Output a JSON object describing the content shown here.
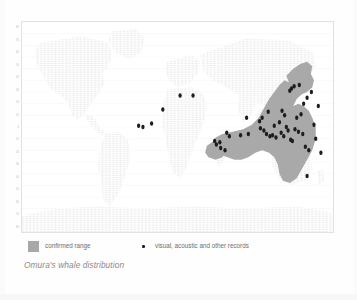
{
  "caption": "Omura's whale distribution",
  "legend": {
    "range": {
      "label": "confirmed range",
      "color": "#a8a8a8",
      "icon": "filled-square-swatch"
    },
    "records": {
      "label": "visual, acoustic and other records",
      "color": "#1d1d1d",
      "icon": "dot-marker"
    }
  },
  "axis": {
    "y_label": "",
    "y_ticks": [
      "80",
      "70",
      "60",
      "50",
      "40",
      "30",
      "20",
      "10",
      "0",
      "10",
      "20",
      "30",
      "40",
      "50",
      "60",
      "70",
      "80"
    ]
  },
  "chart_data": {
    "type": "scatter",
    "title": "Omura's whale distribution",
    "subtitle": "",
    "xlabel": "Longitude",
    "ylabel": "Latitude",
    "xlim": [
      -180,
      180
    ],
    "ylim": [
      -90,
      90
    ],
    "grid": true,
    "legend_position": "below-plot",
    "projection": "equirectangular world map",
    "basemap": {
      "land_color": "#ececec",
      "ocean_color": "#ffffff",
      "graticule_color": "#f0f0f0"
    },
    "series": [
      {
        "name": "confirmed range",
        "type": "polygon-overlay",
        "color": "#a8a8a8",
        "description": "Tropical Indo-Pacific band from the western Indian Ocean across Indonesia, the Philippines and the western Pacific to Japan and northern Australia"
      },
      {
        "name": "visual, acoustic and other records",
        "type": "points",
        "color": "#1d1d1d",
        "points": [
          {
            "lon": -45,
            "lat": 1
          },
          {
            "lon": -40,
            "lat": 0
          },
          {
            "lon": -30,
            "lat": 3
          },
          {
            "lon": -17,
            "lat": 15
          },
          {
            "lon": 3,
            "lat": 27
          },
          {
            "lon": 18,
            "lat": 27
          },
          {
            "lon": 43,
            "lat": -12
          },
          {
            "lon": 45,
            "lat": -15
          },
          {
            "lon": 49,
            "lat": -13
          },
          {
            "lon": 50,
            "lat": -18
          },
          {
            "lon": 55,
            "lat": -20
          },
          {
            "lon": 57,
            "lat": -5
          },
          {
            "lon": 60,
            "lat": -8
          },
          {
            "lon": 73,
            "lat": -7
          },
          {
            "lon": 80,
            "lat": 8
          },
          {
            "lon": 82,
            "lat": -6
          },
          {
            "lon": 95,
            "lat": 5
          },
          {
            "lon": 96,
            "lat": -1
          },
          {
            "lon": 98,
            "lat": 8
          },
          {
            "lon": 100,
            "lat": -3
          },
          {
            "lon": 103,
            "lat": -6
          },
          {
            "lon": 105,
            "lat": 13
          },
          {
            "lon": 107,
            "lat": -8
          },
          {
            "lon": 110,
            "lat": -7
          },
          {
            "lon": 112,
            "lat": 1
          },
          {
            "lon": 114,
            "lat": -9
          },
          {
            "lon": 118,
            "lat": 4
          },
          {
            "lon": 120,
            "lat": -5
          },
          {
            "lon": 121,
            "lat": 14
          },
          {
            "lon": 123,
            "lat": -8
          },
          {
            "lon": 124,
            "lat": 10
          },
          {
            "lon": 126,
            "lat": 0
          },
          {
            "lon": 128,
            "lat": -3
          },
          {
            "lon": 130,
            "lat": 31
          },
          {
            "lon": 131,
            "lat": -11
          },
          {
            "lon": 132,
            "lat": 33
          },
          {
            "lon": 133,
            "lat": -12
          },
          {
            "lon": 135,
            "lat": 35
          },
          {
            "lon": 136,
            "lat": -2
          },
          {
            "lon": 138,
            "lat": 8
          },
          {
            "lon": 140,
            "lat": -4
          },
          {
            "lon": 141,
            "lat": 36
          },
          {
            "lon": 143,
            "lat": 11
          },
          {
            "lon": 145,
            "lat": -6
          },
          {
            "lon": 146,
            "lat": 20
          },
          {
            "lon": 148,
            "lat": -17
          },
          {
            "lon": 150,
            "lat": 25
          },
          {
            "lon": 152,
            "lat": -20
          },
          {
            "lon": 155,
            "lat": 30
          },
          {
            "lon": 158,
            "lat": 2
          },
          {
            "lon": 160,
            "lat": -10
          },
          {
            "lon": 163,
            "lat": 18
          },
          {
            "lon": 166,
            "lat": -22
          },
          {
            "lon": 150,
            "lat": -42
          }
        ]
      }
    ]
  }
}
